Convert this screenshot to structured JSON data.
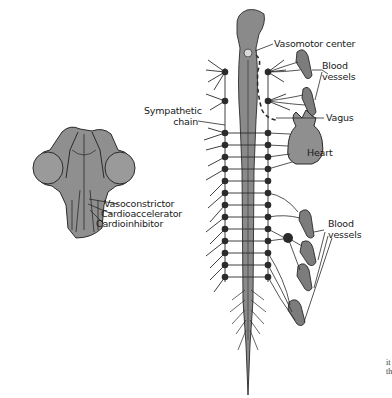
{
  "figure": {
    "labels": {
      "vasomotor_center": "Vasomotor center",
      "blood_vessels_upper_1": "Blood",
      "blood_vessels_upper_2": "vessels",
      "vagus": "Vagus",
      "heart": "Heart",
      "sympathetic_chain_1": "Sympathetic",
      "sympathetic_chain_2": "chain",
      "blood_vessels_lower_1": "Blood",
      "blood_vessels_lower_2": "vessels",
      "vasoconstrictor": "Vasoconstrictor",
      "cardioaccelerator": "Cardioaccelerator",
      "cardioinhibitor": "Cardioinhibitor"
    },
    "edge_text": [
      "it",
      "th"
    ],
    "colors": {
      "tissue_fill": "#8a8a8a",
      "stroke": "#2a2a2a",
      "ganglion": "#2b2b2b",
      "background": "#ffffff"
    },
    "ganglia_y": [
      72,
      101,
      133,
      145,
      157,
      169,
      181,
      193,
      205,
      217,
      229,
      241,
      253,
      265,
      277
    ]
  }
}
